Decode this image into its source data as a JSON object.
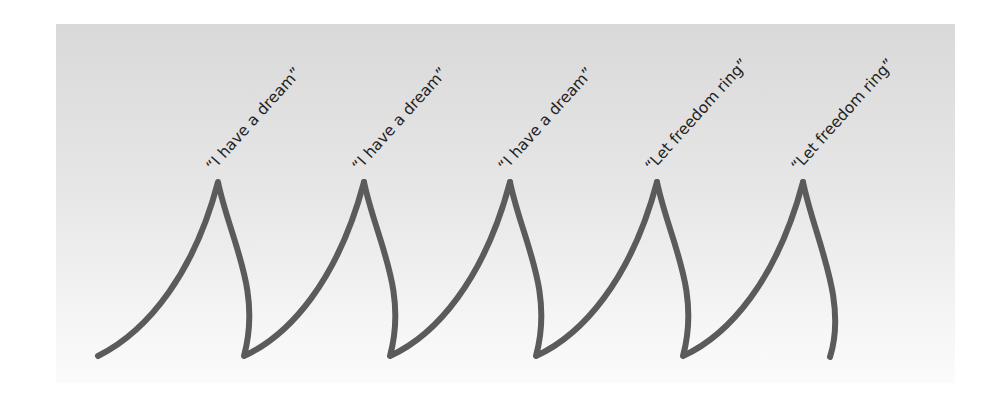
{
  "diagram": {
    "background_color": "#e3e3e3",
    "stroke_color": "#5b5b5b",
    "peaks": [
      {
        "label": "“I have a dream”",
        "x": 218,
        "y": 180
      },
      {
        "label": "“I have a dream”",
        "x": 364,
        "y": 180
      },
      {
        "label": "“I have a dream”",
        "x": 510,
        "y": 180
      },
      {
        "label": "“Let freedom ring”",
        "x": 657,
        "y": 180
      },
      {
        "label": "“Let freedom ring”",
        "x": 803,
        "y": 180
      }
    ]
  }
}
